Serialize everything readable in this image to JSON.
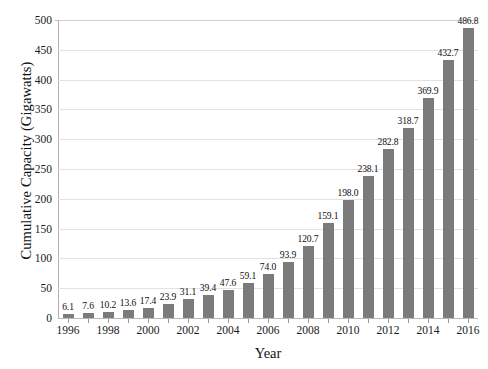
{
  "chart_data": {
    "type": "bar",
    "title": "",
    "xlabel": "Year",
    "ylabel": "Cumulative Capacity (Gigawatts)",
    "categories": [
      1996,
      1997,
      1998,
      1999,
      2000,
      2001,
      2002,
      2003,
      2004,
      2005,
      2006,
      2007,
      2008,
      2009,
      2010,
      2011,
      2012,
      2013,
      2014,
      2015,
      2016
    ],
    "values": [
      6.1,
      7.6,
      10.2,
      13.6,
      17.4,
      23.9,
      31.1,
      39.4,
      47.6,
      59.1,
      74.0,
      93.9,
      120.7,
      159.1,
      198.0,
      238.1,
      282.8,
      318.7,
      369.9,
      432.7,
      486.8
    ],
    "value_labels": [
      "6.1",
      "7.6",
      "10.2",
      "13.6",
      "17.4",
      "23.9",
      "31.1",
      "39.4",
      "47.6",
      "59.1",
      "74.0",
      "93.9",
      "120.7",
      "159.1",
      "198.0",
      "238.1",
      "282.8",
      "318.7",
      "369.9",
      "432.7",
      "486.8"
    ],
    "ylim": [
      0,
      500
    ],
    "xlim": [
      1995.5,
      2016.5
    ],
    "y_ticks": [
      0,
      50,
      100,
      150,
      200,
      250,
      300,
      350,
      400,
      450,
      500
    ],
    "y_tick_labels": [
      "0",
      "50",
      "100",
      "150",
      "200",
      "250",
      "300",
      "350",
      "400",
      "450",
      "500"
    ],
    "x_tick_labels": [
      "1996",
      "1998",
      "2000",
      "2002",
      "2004",
      "2006",
      "2008",
      "2010",
      "2012",
      "2014",
      "2016"
    ],
    "x_tick_values": [
      1996,
      1998,
      2000,
      2002,
      2004,
      2006,
      2008,
      2010,
      2012,
      2014,
      2016
    ],
    "x_minor_tick_values": [
      1997,
      1999,
      2001,
      2003,
      2005,
      2007,
      2009,
      2011,
      2013,
      2015
    ],
    "grid": "horizontal",
    "legend": "none",
    "bar_color": "#7b7b7b",
    "gridline_color": "#e2e2e2",
    "axis_color": "#b0b0b0",
    "background_color": "#ffffff",
    "text_color": "#1a1a1a"
  }
}
